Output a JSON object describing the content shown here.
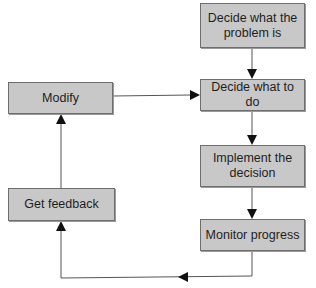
{
  "diagram": {
    "type": "flowchart",
    "title": "",
    "colors": {
      "box_fill": "#c8c8c8",
      "box_border": "#6e6e6e",
      "line": "#555555",
      "arrowhead": "#111111",
      "text": "#1e1e1e"
    },
    "nodes": [
      {
        "id": "define_problem",
        "label": "Decide what the problem is"
      },
      {
        "id": "decide_action",
        "label": "Decide what to do"
      },
      {
        "id": "implement",
        "label": "Implement the decision"
      },
      {
        "id": "monitor",
        "label": "Monitor progress"
      },
      {
        "id": "feedback",
        "label": "Get feedback"
      },
      {
        "id": "modify",
        "label": "Modify"
      }
    ],
    "edges": [
      {
        "from": "define_problem",
        "to": "decide_action"
      },
      {
        "from": "decide_action",
        "to": "implement"
      },
      {
        "from": "implement",
        "to": "monitor"
      },
      {
        "from": "monitor",
        "to": "feedback"
      },
      {
        "from": "feedback",
        "to": "modify"
      },
      {
        "from": "modify",
        "to": "decide_action"
      }
    ]
  }
}
